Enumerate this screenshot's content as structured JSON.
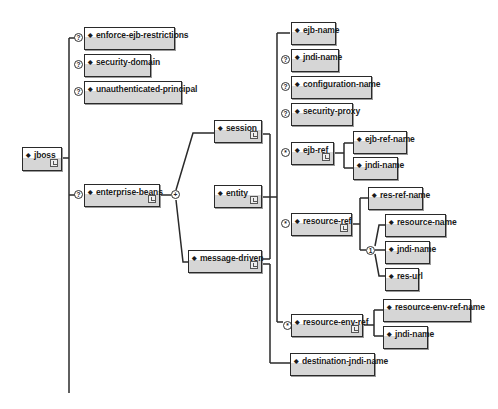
{
  "diagram": {
    "root": {
      "label": "jboss"
    },
    "level1": [
      {
        "label": "enforce-ejb-restrictions",
        "occurrence": "?"
      },
      {
        "label": "security-domain",
        "occurrence": "?"
      },
      {
        "label": "unauthenticated-principal",
        "occurrence": "?"
      },
      {
        "label": "enterprise-beans",
        "occurrence": "?",
        "compositor": "+"
      }
    ],
    "beans": [
      {
        "label": "session"
      },
      {
        "label": "entity"
      },
      {
        "label": "message-driven"
      }
    ],
    "bean_children": [
      {
        "label": "ejb-name",
        "occurrence": ""
      },
      {
        "label": "jndi-name",
        "occurrence": "?"
      },
      {
        "label": "configuration-name",
        "occurrence": "?"
      },
      {
        "label": "security-proxy",
        "occurrence": "?"
      },
      {
        "label": "ejb-ref",
        "occurrence": "*"
      },
      {
        "label": "resource-ref",
        "occurrence": "*"
      },
      {
        "label": "resource-env-ref",
        "occurrence": "*"
      },
      {
        "label": "destination-jndi-name",
        "occurrence": ""
      }
    ],
    "ejb_ref_children": [
      {
        "label": "ejb-ref-name"
      },
      {
        "label": "jndi-name"
      }
    ],
    "resource_ref_children": [
      {
        "label": "res-ref-name"
      }
    ],
    "resource_ref_choice": {
      "compositor": "1",
      "items": [
        {
          "label": "resource-name"
        },
        {
          "label": "jndi-name"
        },
        {
          "label": "res-url"
        }
      ]
    },
    "resource_env_ref_children": [
      {
        "label": "resource-env-ref-name"
      },
      {
        "label": "jndi-name"
      }
    ]
  }
}
